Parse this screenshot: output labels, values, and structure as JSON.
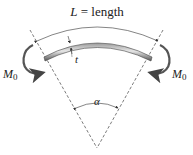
{
  "diagram": {
    "title_label": {
      "var": "L",
      "eq": " = ",
      "word": "length"
    },
    "thickness_label": "t",
    "angle_label": "α",
    "moment_left": {
      "symbol": "M",
      "subscript": "0"
    },
    "moment_right": {
      "symbol": "M",
      "subscript": "0"
    },
    "colors": {
      "line": "#333333",
      "beam_dark": "#555555",
      "beam_light": "#d8d8d8",
      "text": "#222222"
    }
  }
}
